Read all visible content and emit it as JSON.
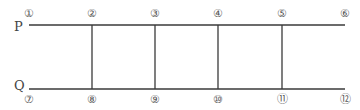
{
  "diagram": {
    "rails": [
      {
        "name": "P",
        "label": "P",
        "y": 25
      },
      {
        "name": "Q",
        "label": "Q",
        "y": 89
      }
    ],
    "x_start": 29,
    "x_end": 345,
    "rungs_x": [
      92,
      155,
      218,
      282
    ],
    "line_color": "#3a3a3a",
    "top_nodes": [
      {
        "label": "①",
        "x": 29
      },
      {
        "label": "②",
        "x": 92
      },
      {
        "label": "③",
        "x": 155
      },
      {
        "label": "④",
        "x": 218
      },
      {
        "label": "⑤",
        "x": 282
      },
      {
        "label": "⑥",
        "x": 345
      }
    ],
    "bottom_nodes": [
      {
        "label": "⑦",
        "x": 29
      },
      {
        "label": "⑧",
        "x": 92
      },
      {
        "label": "⑨",
        "x": 155
      },
      {
        "label": "⑩",
        "x": 218
      },
      {
        "label": "⑪",
        "x": 282
      },
      {
        "label": "⑫",
        "x": 345
      }
    ]
  }
}
